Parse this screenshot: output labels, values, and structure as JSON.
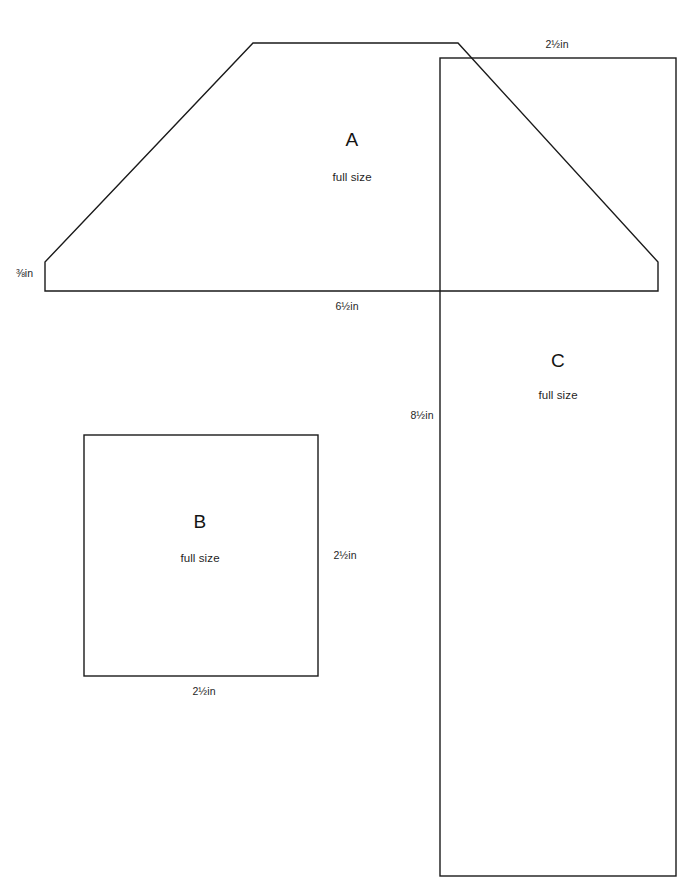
{
  "page": {
    "background_color": "#ffffff",
    "line_color": "#1a1a1a",
    "text_color": "#1f1f1f",
    "width": 700,
    "height": 891
  },
  "pieces": [
    {
      "id": "A",
      "letter": "A",
      "scale_note": "full size",
      "shape": "trapezoid",
      "dimensions": [
        {
          "name": "left-edge",
          "value": "⅜in"
        },
        {
          "name": "bottom-edge",
          "value": "6½in"
        }
      ]
    },
    {
      "id": "B",
      "letter": "B",
      "scale_note": "full size",
      "shape": "square",
      "dimensions": [
        {
          "name": "right-edge",
          "value": "2½in"
        },
        {
          "name": "bottom-edge",
          "value": "2½in"
        }
      ]
    },
    {
      "id": "C",
      "letter": "C",
      "scale_note": "full size",
      "shape": "rectangle",
      "dimensions": [
        {
          "name": "top-edge",
          "value": "2½in"
        },
        {
          "name": "left-edge",
          "value": "8½in"
        }
      ]
    }
  ],
  "labels": {
    "a_letter": "A",
    "a_sub": "full size",
    "a_left_dim": "⅜in",
    "a_bottom_dim": "6½in",
    "b_letter": "B",
    "b_sub": "full size",
    "b_right_dim": "2½in",
    "b_bottom_dim": "2½in",
    "c_letter": "C",
    "c_sub": "full size",
    "c_top_dim": "2½in",
    "c_left_dim": "8½in"
  }
}
